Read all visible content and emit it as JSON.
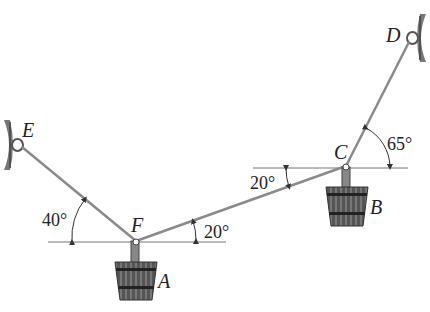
{
  "diagram": {
    "points": {
      "E": {
        "label": "E"
      },
      "F": {
        "label": "F"
      },
      "C": {
        "label": "C"
      },
      "D": {
        "label": "D"
      },
      "A": {
        "label": "A"
      },
      "B": {
        "label": "B"
      }
    },
    "angles": {
      "EF_horizontal": "40°",
      "FC_at_F": "20°",
      "FC_at_C": "20°",
      "CD_horizontal": "65°"
    },
    "colors": {
      "cable": "#8a8a8a",
      "wall": "#6e6e6e",
      "bucket": "#3a3a3a",
      "text": "#222222"
    }
  }
}
